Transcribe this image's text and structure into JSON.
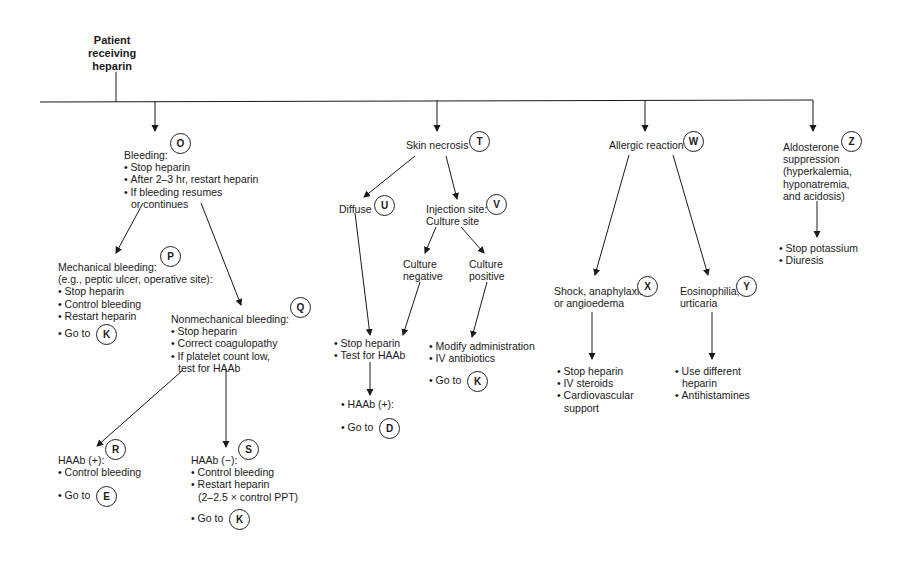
{
  "root": {
    "title": [
      "Patient",
      "receiving",
      "heparin"
    ]
  },
  "branches": {
    "bleeding": {
      "badge": "O",
      "title": "Bleeding:",
      "items": [
        "Stop heparin",
        "After 2–3 hr, restart heparin",
        "If bleeding resumes"
      ],
      "continuation": "or continues"
    },
    "mechanical": {
      "badge": "P",
      "title": "Mechanical bleeding:",
      "subtitle": "(e.g., peptic ulcer, operative site):",
      "items": [
        "Stop heparin",
        "Control bleeding",
        "Restart heparin"
      ],
      "goto_label": "Go to",
      "goto_badge": "K"
    },
    "nonmechanical": {
      "badge": "Q",
      "title": "Nonmechanical bleeding:",
      "items": [
        "Stop heparin",
        "Correct coagulopathy",
        "If platelet count low,"
      ],
      "continuation": "test for HAAb"
    },
    "haab_pos": {
      "badge": "R",
      "title": "HAAb (+):",
      "items": [
        "Control bleeding"
      ],
      "goto_label": "Go to",
      "goto_badge": "E"
    },
    "haab_neg": {
      "badge": "S",
      "title": "HAAb (−):",
      "items": [
        "Control bleeding",
        "Restart heparin"
      ],
      "continuation": "(2–2.5 × control PPT)",
      "goto_label": "Go to",
      "goto_badge": "K"
    },
    "skin_necrosis": {
      "badge": "T",
      "title": "Skin necrosis"
    },
    "diffuse": {
      "badge": "U",
      "title": "Diffuse"
    },
    "injection_site": {
      "badge": "V",
      "title": [
        "Injection site:",
        "Culture site"
      ]
    },
    "culture_negative": {
      "title": [
        "Culture",
        "negative"
      ]
    },
    "culture_positive": {
      "title": [
        "Culture",
        "positive"
      ]
    },
    "diffuse_action": {
      "items": [
        "Stop heparin",
        "Test for HAAb"
      ]
    },
    "diffuse_result": {
      "items": [
        "HAAb (+):"
      ],
      "goto_label": "Go to",
      "goto_badge": "D"
    },
    "culture_pos_action": {
      "items": [
        "Modify administration",
        "IV antibiotics"
      ],
      "goto_label": "Go to",
      "goto_badge": "K"
    },
    "allergic": {
      "badge": "W",
      "title": "Allergic reaction"
    },
    "shock": {
      "badge": "X",
      "title": [
        "Shock, anaphylaxis,",
        "or angioedema"
      ]
    },
    "shock_action": {
      "items": [
        "Stop heparin",
        "IV steroids",
        "Cardiovascular"
      ],
      "continuation": "support"
    },
    "eosinophilia": {
      "badge": "Y",
      "title": [
        "Eosinophilia,",
        "urticaria"
      ]
    },
    "eosinophilia_action": {
      "items": [
        "Use different"
      ],
      "continuation": "heparin",
      "items2": [
        "Antihistamines"
      ]
    },
    "aldosterone": {
      "badge": "Z",
      "title": [
        "Aldosterone",
        "suppression",
        "(hyperkalemia,",
        "hyponatremia,",
        "and acidosis)"
      ]
    },
    "aldosterone_action": {
      "items": [
        "Stop potassium",
        "Diuresis"
      ]
    }
  },
  "colors": {
    "line": "#1a1a1a",
    "text": "#1a1a1a",
    "background": "#ffffff"
  }
}
